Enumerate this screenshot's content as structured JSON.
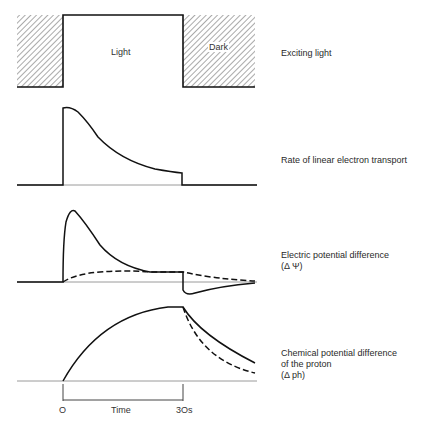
{
  "diagram": {
    "panels": [
      {
        "id": "exciting-light",
        "label": "Exciting light",
        "regions": {
          "light": "Light",
          "dark": "Dark"
        }
      },
      {
        "id": "electron-transport",
        "label": "Rate of linear electron transport"
      },
      {
        "id": "electric-potential",
        "label_line1": "Electric potential difference",
        "label_line2": "(Δ Ψ)"
      },
      {
        "id": "chemical-potential",
        "label_line1": "Chemical potential difference",
        "label_line2": "of the proton",
        "label_line3": "(Δ ph)"
      }
    ],
    "time_axis": {
      "start": "O",
      "label": "Time",
      "end": "3Os"
    },
    "colors": {
      "line": "#111111",
      "baseline": "#9a9a9a",
      "hatch": "#555555"
    }
  }
}
